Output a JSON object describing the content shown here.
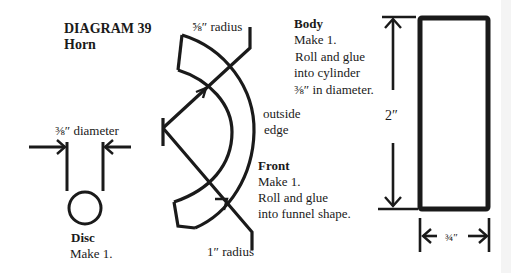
{
  "title": {
    "heading": "DIAGRAM 39",
    "subtitle": "Horn"
  },
  "front_piece": {
    "inner_radius_label": "⅝″ radius",
    "outer_radius_label": "1″ radius",
    "outside_edge_line1": "outside",
    "outside_edge_line2": "edge",
    "name": "Front",
    "line1": "Make 1.",
    "line2": "Roll and glue",
    "line3": "into funnel shape."
  },
  "disc_piece": {
    "dimension_label": "⅜″ diameter",
    "name": "Disc",
    "line1": "Make 1."
  },
  "body_piece": {
    "name": "Body",
    "line1": "Make 1.",
    "line2": "Roll and glue",
    "line3": "into cylinder",
    "line4": "⅜″ in diameter.",
    "height_label": "2″",
    "width_label": "¾″"
  },
  "colors": {
    "ink": "#1a1a1a",
    "paper": "#ffffff"
  }
}
